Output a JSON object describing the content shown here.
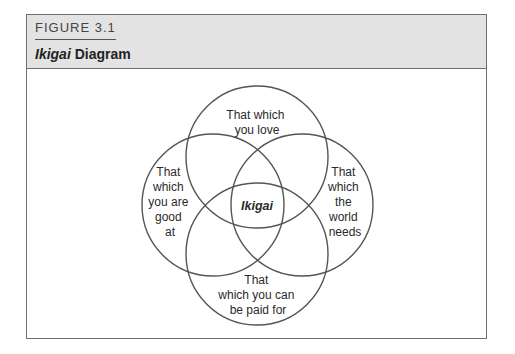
{
  "figure": {
    "label": "FIGURE 3.1",
    "title_italic": "Ikigai",
    "title_rest": " Diagram"
  },
  "diagram": {
    "type": "four-circle venn",
    "center_label": "Ikigai",
    "circles": [
      {
        "id": "top",
        "lines": [
          "That which",
          "you love"
        ]
      },
      {
        "id": "left",
        "lines": [
          "That",
          "which",
          "you are",
          "good",
          "at"
        ]
      },
      {
        "id": "right",
        "lines": [
          "That",
          "which",
          "the",
          "world",
          "needs"
        ]
      },
      {
        "id": "bottom",
        "lines": [
          "That",
          "which you can",
          "be paid for"
        ]
      }
    ],
    "stroke_color": "#555555",
    "header_bg": "#e3e3e3"
  }
}
